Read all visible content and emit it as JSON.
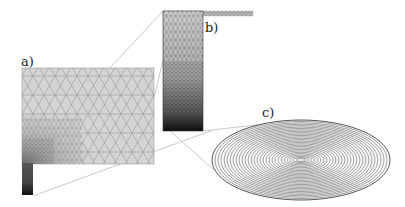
{
  "figure": {
    "panels": [
      {
        "id": "a",
        "label": "a)",
        "description": "coarse triangular mesh of rectangular domain with refined corner and small dark column"
      },
      {
        "id": "b",
        "label": "b)",
        "description": "zoomed column mesh, refined toward bottom"
      },
      {
        "id": "c",
        "label": "c)",
        "description": "concentric-ring elliptical disc (perspective view)"
      }
    ]
  },
  "colors": {
    "mesh_fill": "#d2d2d2",
    "mesh_line": "#7a7a7a",
    "dense_fill": "#2a2a2a",
    "connector": "#b8b8b8",
    "ring": "#555555",
    "background": "#ffffff"
  }
}
